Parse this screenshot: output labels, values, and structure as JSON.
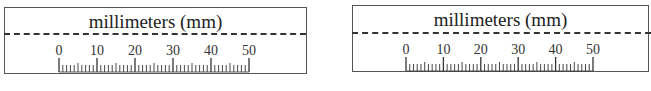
{
  "panels": [
    {
      "title": "millimeters (mm)",
      "unit": "mm",
      "scale": {
        "min": 0,
        "max": 50,
        "major_step": 10,
        "minor_step": 1
      },
      "major_labels": [
        "0",
        "10",
        "20",
        "30",
        "40",
        "50"
      ]
    },
    {
      "title": "millimeters (mm)",
      "unit": "mm",
      "scale": {
        "min": 0,
        "max": 50,
        "major_step": 10,
        "minor_step": 1
      },
      "major_labels": [
        "0",
        "10",
        "20",
        "30",
        "40",
        "50"
      ]
    }
  ],
  "colors": {
    "line": "#333333",
    "border": "#555555",
    "text": "#222222"
  }
}
